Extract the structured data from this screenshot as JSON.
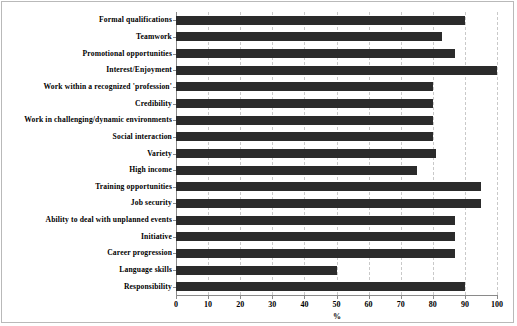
{
  "chart_data": {
    "type": "bar",
    "orientation": "horizontal",
    "title": "",
    "xlabel": "%",
    "ylabel": "",
    "xlim": [
      0,
      100
    ],
    "xticks": [
      "0",
      "10",
      "20",
      "30",
      "40",
      "50",
      "60",
      "70",
      "80",
      "90",
      "100"
    ],
    "grid": "vertical-dashed",
    "legend": "none",
    "bar_color": "#2b2b2b",
    "categories": [
      "Formal qualifications",
      "Teamwork",
      "Promotional opportunities",
      "Interest/Enjoyment",
      "Work within a recognized 'profession'",
      "Credibility",
      "Work in challenging/dynamic environments",
      "Social interaction",
      "Variety",
      "High income",
      "Training opportunities",
      "Job security",
      "Ability to deal with unplanned  events",
      "Initiative",
      "Career progression",
      "Language skills",
      "Responsibility"
    ],
    "values": [
      90,
      83,
      87,
      100,
      80,
      80,
      80,
      80,
      81,
      75,
      95,
      95,
      87,
      87,
      87,
      50,
      90
    ]
  }
}
